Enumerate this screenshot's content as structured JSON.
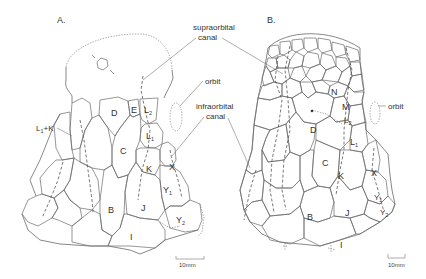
{
  "figure": {
    "panels": [
      {
        "id": "A",
        "label": "A.",
        "plates": {
          "D": "D",
          "E": "E",
          "L2": "L",
          "L2_sub": "2",
          "L1": "L",
          "L1_sub": "1",
          "C": "C",
          "K": "K",
          "X": "X",
          "Y1": "Y",
          "Y1_sub": "1",
          "B": "B",
          "J": "J",
          "Y2": "Y",
          "Y2_sub": "2",
          "I": "I",
          "L1K": "L",
          "L1K_sub": "1",
          "L1K_suffix": "+K"
        },
        "scale_bar": "10mm"
      },
      {
        "id": "B",
        "label": "B.",
        "plates": {
          "N": "N",
          "M": "M",
          "L2": "L",
          "L2_sub": "2",
          "D": "D",
          "L1": "L",
          "L1_sub": "1",
          "C": "C",
          "K": "K",
          "X": "X",
          "Y1": "Y",
          "Y1_sub": "1",
          "Y2": "Y",
          "Y2_sub": "2",
          "B": "B",
          "J": "J",
          "I": "I"
        },
        "orbit_label": "orbit",
        "scale_bar": "10mm"
      }
    ],
    "annotations": {
      "supraorbital_line1": "supraorbital",
      "supraorbital_line2": "canal",
      "orbit": "orbit",
      "infraorbital_line1": "infraorbital",
      "infraorbital_line2": "canal"
    }
  }
}
